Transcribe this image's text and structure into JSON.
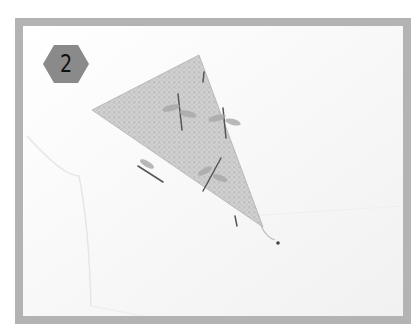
{
  "figure": {
    "step_number": "2",
    "badge_shape": "hexagon",
    "colors": {
      "frame": "#b3b3b3",
      "badge_fill": "#8a8a8a",
      "badge_text": "#111111",
      "paper": "#fbfbfb",
      "patterned_flap": "#c4c4c4"
    },
    "illustration": "folded white paper with a triangular patterned (dragonfly print) flap"
  }
}
